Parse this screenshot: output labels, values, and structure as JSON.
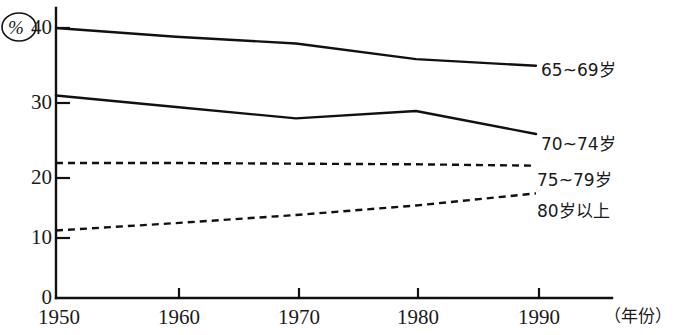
{
  "chart_data": {
    "type": "line",
    "title": "",
    "subtitle": "",
    "xlabel": "（年份）",
    "ylabel": "%",
    "x": [
      1950,
      1960,
      1970,
      1980,
      1990
    ],
    "categories": [
      "1950",
      "1960",
      "1970",
      "1980",
      "1990"
    ],
    "xlim": [
      1950,
      1994
    ],
    "ylim": [
      0,
      42
    ],
    "ytick_values": [
      0,
      10,
      20,
      30,
      40
    ],
    "ytick_labels": [
      "0",
      "10",
      "20",
      "30",
      "40"
    ],
    "xtick_labels": [
      "1950",
      "1960",
      "1970",
      "1980",
      "1990"
    ],
    "grid": false,
    "legend_position": "right-inline",
    "series": [
      {
        "name": "65~69岁",
        "label": "65~69岁",
        "style": "solid",
        "color": "#111111",
        "values": [
          40.0,
          38.7,
          37.7,
          35.4,
          34.4
        ]
      },
      {
        "name": "70~74岁",
        "label": "70~74岁",
        "style": "solid",
        "color": "#111111",
        "values": [
          30.0,
          28.3,
          26.6,
          27.7,
          24.3
        ]
      },
      {
        "name": "75~79岁",
        "label": "75~79岁",
        "style": "dashed",
        "color": "#111111",
        "values": [
          20.0,
          20.0,
          19.9,
          19.8,
          19.6
        ]
      },
      {
        "name": "80岁以上",
        "label": "80岁以上",
        "style": "dashed",
        "color": "#111111",
        "values": [
          10.0,
          11.1,
          12.3,
          13.7,
          15.5
        ]
      }
    ]
  },
  "axes": {
    "y_unit_label": "%",
    "x_unit_label": "（年份）",
    "y_ticks": [
      {
        "label": "40",
        "value": 40
      },
      {
        "label": "30",
        "value": 30
      },
      {
        "label": "20",
        "value": 20
      },
      {
        "label": "10",
        "value": 10
      },
      {
        "label": "0",
        "value": 0
      }
    ],
    "x_ticks": [
      {
        "label": "1950",
        "value": 1950
      },
      {
        "label": "1960",
        "value": 1960
      },
      {
        "label": "1970",
        "value": 1970
      },
      {
        "label": "1980",
        "value": 1980
      },
      {
        "label": "1990",
        "value": 1990
      }
    ]
  },
  "series_labels": {
    "s0": "65~69岁",
    "s1": "70~74岁",
    "s2": "75~79岁",
    "s3": "80岁以上"
  }
}
